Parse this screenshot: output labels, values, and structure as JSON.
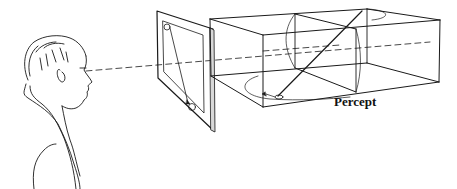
{
  "figure": {
    "type": "perception diagram",
    "labels": {
      "percept": "Percept"
    },
    "elements": {
      "observer": "man in profile looking right",
      "sight_line": "dashed line of sight",
      "picture_plane": "rectangular frame with two circles connected by an arrow",
      "percept_box": "3D wireframe box containing elliptical paths and a diagonal arrow"
    },
    "colors": {
      "ink": "#1a1a1a",
      "background": "#ffffff"
    }
  }
}
